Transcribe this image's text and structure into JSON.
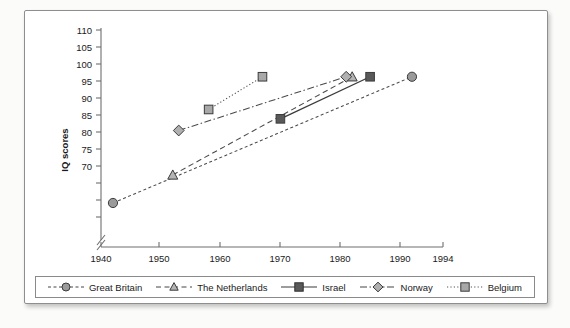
{
  "chart_data": {
    "type": "line",
    "title": "",
    "xlabel": "",
    "ylabel": "IQ scores",
    "xlim": [
      1940,
      1994
    ],
    "ylim": [
      68,
      110
    ],
    "grid": false,
    "axis_break_y": true,
    "y_ticks": [
      70,
      75,
      80,
      85,
      90,
      95,
      100,
      105,
      110
    ],
    "x_ticks": [
      1940,
      1950,
      1960,
      1970,
      1980,
      1990,
      1994
    ],
    "legend_position": "bottom",
    "series": [
      {
        "name": "Great Britain",
        "marker": "circle",
        "marker_fill": "#9a9a9a",
        "line_style": "dashed",
        "points": [
          {
            "x": 1942,
            "y": 73
          },
          {
            "x": 1992,
            "y": 100
          }
        ]
      },
      {
        "name": "The Netherlands",
        "marker": "triangle",
        "marker_fill": "#b4b4b4",
        "line_style": "dashed-long",
        "points": [
          {
            "x": 1952,
            "y": 79
          },
          {
            "x": 1982,
            "y": 100
          }
        ]
      },
      {
        "name": "Israel",
        "marker": "square",
        "marker_fill": "#595959",
        "line_style": "solid",
        "points": [
          {
            "x": 1970,
            "y": 91
          },
          {
            "x": 1985,
            "y": 100
          }
        ]
      },
      {
        "name": "Norway",
        "marker": "diamond",
        "marker_fill": "#b0b0b0",
        "line_style": "dash-dot",
        "points": [
          {
            "x": 1953,
            "y": 88.5
          },
          {
            "x": 1981,
            "y": 100
          }
        ]
      },
      {
        "name": "Belgium",
        "marker": "square",
        "marker_fill": "#a8a8a8",
        "line_style": "dotted",
        "points": [
          {
            "x": 1958,
            "y": 93
          },
          {
            "x": 1967,
            "y": 100
          }
        ]
      }
    ]
  },
  "axes": {
    "y_title": "IQ scores",
    "y_tick_labels": [
      "110",
      "105",
      "100",
      "95",
      "90",
      "85",
      "80",
      "75",
      "70"
    ],
    "x_tick_labels": [
      "1940",
      "1950",
      "1960",
      "1970",
      "1980",
      "1990",
      "1994"
    ]
  },
  "legend": {
    "items": [
      {
        "label": "Great Britain",
        "marker": "circle-marker",
        "line_style": "dashed"
      },
      {
        "label": "The Netherlands",
        "marker": "triangle-marker",
        "line_style": "dashed-long"
      },
      {
        "label": "Israel",
        "marker": "square-marker",
        "line_style": "solid"
      },
      {
        "label": "Norway",
        "marker": "diamond-marker",
        "line_style": "dash-dot"
      },
      {
        "label": "Belgium",
        "marker": "square-marker",
        "line_style": "dotted"
      }
    ]
  },
  "colors": {
    "axis": "#6f6f6f",
    "text": "#1a1a1a",
    "frame": "#8e8e8e",
    "page": "#ffffff"
  }
}
